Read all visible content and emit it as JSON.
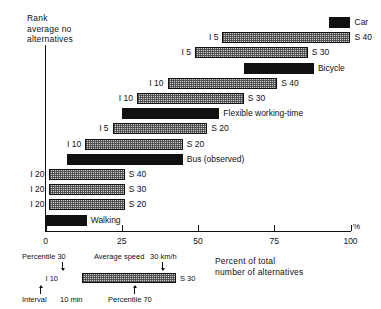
{
  "chart_data": {
    "type": "bar",
    "orientation": "horizontal",
    "title": "",
    "ylabel": "Rank\naverage no\nalternatives",
    "xlabel": "Percent of total\nnumber of alternatives",
    "x_unit": "%",
    "xlim": [
      0,
      100
    ],
    "xticks": [
      0,
      25,
      50,
      75,
      100
    ],
    "xticklabels": [
      "0",
      "25",
      "50",
      "75",
      "100"
    ],
    "grid": false,
    "legend_position": "below-axis-left",
    "note": "Each bar spans from its start percent to its end percent. 'solid' bars are observed/no-alternative modes; 'hatch' bars are public-transport alternatives labelled with interval (I) on the left and average speed (S) on the right.",
    "bars": [
      {
        "rank": 1,
        "style": "solid",
        "start": 93.0,
        "end": 100.0,
        "left_label": "",
        "right_label": "Car"
      },
      {
        "rank": 2,
        "style": "hatch",
        "start": 58.0,
        "end": 100.0,
        "left_label": "I 5",
        "right_label": "S 40"
      },
      {
        "rank": 3,
        "style": "hatch",
        "start": 49.0,
        "end": 86.0,
        "left_label": "I 5",
        "right_label": "S 30"
      },
      {
        "rank": 4,
        "style": "solid",
        "start": 65.0,
        "end": 88.0,
        "left_label": "",
        "right_label": "Bicycle"
      },
      {
        "rank": 5,
        "style": "hatch",
        "start": 40.0,
        "end": 76.0,
        "left_label": "I 10",
        "right_label": "S 40"
      },
      {
        "rank": 6,
        "style": "hatch",
        "start": 30.0,
        "end": 65.0,
        "left_label": "I 10",
        "right_label": "S 30"
      },
      {
        "rank": 7,
        "style": "solid",
        "start": 25.0,
        "end": 57.0,
        "left_label": "",
        "right_label": "Flexible working-time"
      },
      {
        "rank": 8,
        "style": "hatch",
        "start": 22.0,
        "end": 53.0,
        "left_label": "I 5",
        "right_label": "S 20"
      },
      {
        "rank": 9,
        "style": "hatch",
        "start": 13.0,
        "end": 45.0,
        "left_label": "I 10",
        "right_label": "S 20"
      },
      {
        "rank": 10,
        "style": "solid",
        "start": 7.0,
        "end": 45.0,
        "left_label": "",
        "right_label": "Bus (observed)"
      },
      {
        "rank": 11,
        "style": "hatch",
        "start": 1.0,
        "end": 26.0,
        "left_label": "I 20",
        "right_label": "S 40"
      },
      {
        "rank": 12,
        "style": "hatch",
        "start": 1.0,
        "end": 26.0,
        "left_label": "I 20",
        "right_label": "S 30"
      },
      {
        "rank": 13,
        "style": "hatch",
        "start": 1.0,
        "end": 26.0,
        "left_label": "I 20",
        "right_label": "S 20"
      },
      {
        "rank": 14,
        "style": "solid",
        "start": 0.0,
        "end": 13.5,
        "left_label": "",
        "right_label": "Walking"
      }
    ]
  },
  "axis": {
    "y_title": "Rank\naverage no\nalternatives",
    "x_title": "Percent of total\nnumber of alternatives",
    "percent_symbol": "%",
    "ticks": [
      {
        "value": 0,
        "label": "0"
      },
      {
        "value": 25,
        "label": "25"
      },
      {
        "value": 50,
        "label": "50"
      },
      {
        "value": 75,
        "label": "75"
      },
      {
        "value": 100,
        "label": "100"
      }
    ]
  },
  "legend": {
    "top_left_text": "Percentile 30",
    "top_right_text": "Average speed",
    "top_right_value": "30 km/h",
    "bar_left_label": "I 10",
    "bar_right_label": "S 30",
    "bottom_left_text": "Interval",
    "bottom_left_value": "10 min",
    "bottom_right_text": "Percentile 70"
  }
}
